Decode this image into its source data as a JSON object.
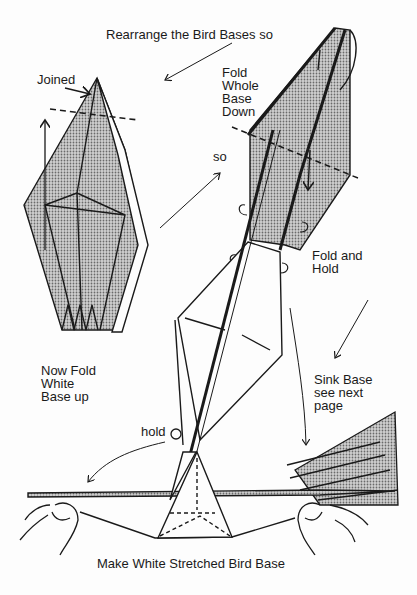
{
  "labels": {
    "top_caption": "Rearrange the Bird Bases so",
    "joined": "Joined",
    "fold_whole_base_down": [
      "Fold",
      "Whole",
      "Base",
      "Down"
    ],
    "so": "so",
    "fold_and_hold": [
      "Fold and",
      "Hold"
    ],
    "now_fold_white_base_up": [
      "Now Fold",
      "White",
      "Base up"
    ],
    "sink_base": [
      "Sink Base",
      "see next",
      "page"
    ],
    "hold": "hold",
    "bottom_caption": "Make White Stretched Bird Base"
  },
  "colors": {
    "ink": "#1a1a1a",
    "shade": "#b8b8b8",
    "paper": "#fdfdfd"
  }
}
